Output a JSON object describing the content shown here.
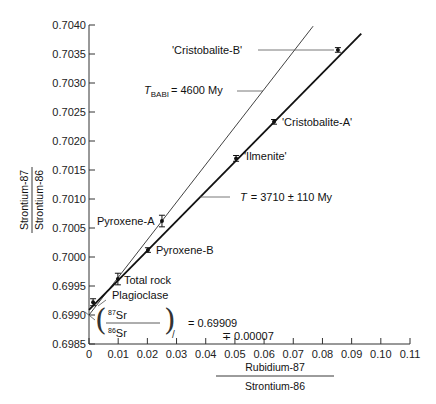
{
  "chart_data": {
    "type": "scatter",
    "title": "",
    "xlabel": "Rubidium-87 / Strontium-86",
    "ylabel": "Strontium-87 / Strontium-86",
    "xlabel_num": "Rubidium-87",
    "xlabel_den": "Strontium-86",
    "ylabel_num": "Strontium-87",
    "ylabel_den": "Strontium-86",
    "xlim": [
      0,
      0.11
    ],
    "ylim": [
      0.6985,
      0.704
    ],
    "grid": false,
    "x_ticks": [
      "0",
      "0.01",
      "0.02",
      "0.03",
      "0.04",
      "0.05",
      "0.06",
      "0.07",
      "0.08",
      "0.09",
      "0.10",
      "0.11"
    ],
    "y_ticks": [
      "0.6985",
      "0.6990",
      "0.6995",
      "0.7000",
      "0.7005",
      "0.7010",
      "0.7015",
      "0.7020",
      "0.7025",
      "0.7030",
      "0.7035",
      "0.7040"
    ],
    "points": [
      {
        "label": "Plagioclase",
        "x": 0.0014,
        "y": 0.69922,
        "err": 6e-05
      },
      {
        "label": "Total rock",
        "x": 0.0099,
        "y": 0.69962,
        "err": 0.0001
      },
      {
        "label": "Pyroxene-B",
        "x": 0.0202,
        "y": 0.70012,
        "err": 4e-05
      },
      {
        "label": "Pyroxene-A",
        "x": 0.025,
        "y": 0.70062,
        "err": 0.0001
      },
      {
        "label": "'Ilmenite'",
        "x": 0.0504,
        "y": 0.7017,
        "err": 5e-05
      },
      {
        "label": "'Cristobalite-A'",
        "x": 0.0634,
        "y": 0.70233,
        "err": 4e-05
      },
      {
        "label": "'Cristobalite-B'",
        "x": 0.0853,
        "y": 0.70357,
        "err": 4e-05
      }
    ],
    "lines": [
      {
        "name": "isochron",
        "label": "T = 3710 ± 110 My",
        "x0": 0,
        "y0": 0.69909,
        "x1": 0.0933,
        "y1": 0.70385,
        "style": "thick"
      },
      {
        "name": "basaltic-achondrite-reference",
        "label": "T_BABI = 4600 My",
        "x0": 0,
        "y0": 0.699,
        "x1": 0.0768,
        "y1": 0.70398,
        "style": "thin"
      }
    ],
    "annotations": {
      "isochron_age": "T = 3710 ± 110 My",
      "babi_prefix": "T",
      "babi_sub": "BABI",
      "babi_value": "= 4600 My",
      "t_prefix": "T",
      "t_value": "= 3710 ± 110 My",
      "intercept_num": "87Sr",
      "intercept_den": "86Sr",
      "intercept_num_sup": "87",
      "intercept_num_el": "Sr",
      "intercept_den_sup": "86",
      "intercept_den_el": "Sr",
      "intercept_value": "= 0.69909",
      "intercept_err": "∓ 0.00007"
    }
  }
}
